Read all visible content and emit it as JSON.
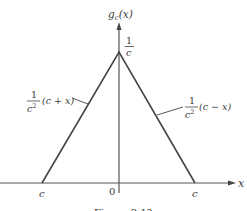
{
  "figure": {
    "type": "triangle-function-plot",
    "y_axis_label": "g_c(x)",
    "y_axis_label_main": "g",
    "y_axis_label_sub": "c",
    "y_axis_label_arg": "(x)",
    "x_axis_label": "x",
    "peak_label_num": "1",
    "peak_label_den": "c",
    "left_slope_label": {
      "num": "1",
      "den": "c",
      "den_exp": "2",
      "expr": "(c + x)"
    },
    "right_slope_label": {
      "num": "1",
      "den": "c",
      "den_exp": "2",
      "expr": "(c − x)"
    },
    "x_ticks": [
      "c",
      "0",
      "c"
    ],
    "caption": "Figure 3.1?"
  },
  "colors": {
    "line": "#444444",
    "text": "#3a3a3a",
    "background": "#ffffff"
  }
}
